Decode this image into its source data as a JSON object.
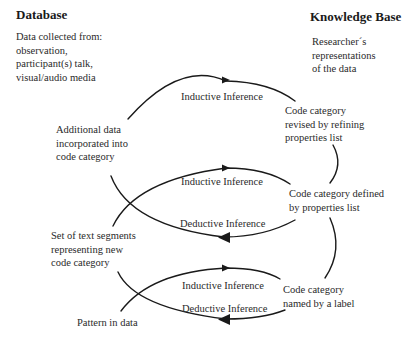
{
  "left_header": {
    "title": "Database",
    "lines": [
      "Data collected from:",
      "observation,",
      "participant(s) talk,",
      "visual/audio media"
    ]
  },
  "right_header": {
    "title": "Knowledge Base",
    "lines": [
      "Researcher´s",
      "representations",
      "of the data"
    ]
  },
  "nodes": {
    "additional_data": [
      "Additional data",
      "incorporated into",
      "code category"
    ],
    "code_revised": [
      "Code category",
      "revised by refining",
      "properties list"
    ],
    "code_defined": [
      "Code category defined",
      "by properties list"
    ],
    "text_segments": [
      "Set of text segments",
      "representing new",
      "code category"
    ],
    "code_named": [
      "Code category",
      "named by a label"
    ],
    "pattern": "Pattern in data"
  },
  "arrows": {
    "top_inductive": "Inductive Inference",
    "mid_inductive": "Inductive Inference",
    "mid_deductive": "Deductive Inference",
    "bottom_inductive": "Inductive Inference",
    "bottom_deductive": "Deductive Inference"
  },
  "colors": {
    "line": "#1a1a1a",
    "text": "#2a2a2a",
    "background": "#ffffff"
  }
}
